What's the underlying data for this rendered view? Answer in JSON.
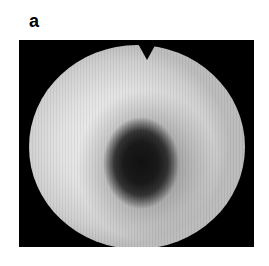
{
  "figure": {
    "panel_label": "a",
    "image": {
      "description": "grayscale circular endoscopic-style field of view with a central dark region",
      "colors": {
        "background": "#000000",
        "field": "#e6e6e6",
        "dark_region": "#151515"
      }
    }
  }
}
